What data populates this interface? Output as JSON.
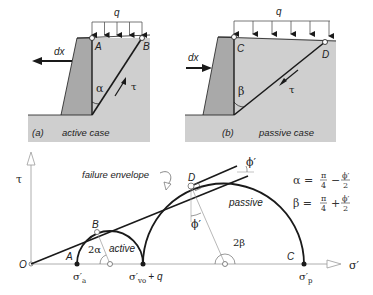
{
  "panels": {
    "active": {
      "tag": "(a)",
      "caption": "active case",
      "surcharge_label": "q",
      "movement_label": "dx",
      "point_top_wall": "A",
      "point_top_slip": "B",
      "angle_label": "α",
      "shear_label": "τ"
    },
    "passive": {
      "tag": "(b)",
      "caption": "passive case",
      "surcharge_label": "q",
      "movement_label": "dx",
      "point_top_wall": "C",
      "point_top_slip": "D",
      "angle_label": "β",
      "shear_label": "τ"
    }
  },
  "mohr": {
    "y_axis_label": "τ",
    "x_axis_label": "σ′",
    "origin_label": "O",
    "envelope_label": "failure envelope",
    "friction_angle_label": "ϕ′",
    "friction_angle_label_2": "ϕ′",
    "active_circle_label": "active",
    "passive_circle_label": "passive",
    "active_angle_label": "2α",
    "passive_angle_label": "2β",
    "point_A": "A",
    "point_B": "B",
    "point_C": "C",
    "point_D": "D",
    "sigma_a": "σ′",
    "sigma_a_sub": "a",
    "sigma_v0q": "σ′",
    "sigma_v0q_sub": "vo",
    "sigma_v0q_suffix": "+ q",
    "sigma_p": "σ′",
    "sigma_p_sub": "p"
  },
  "equations": {
    "alpha_lhs": "α =",
    "alpha_op": "−",
    "beta_lhs": "β =",
    "beta_op": "+",
    "pi": "π",
    "four": "4",
    "phi": "ϕ′",
    "two": "2"
  },
  "colors": {
    "ground": "#cfcfcf",
    "wall": "#a9a9a9",
    "line": "#1a1a1a",
    "axis": "#9a9a9a"
  }
}
